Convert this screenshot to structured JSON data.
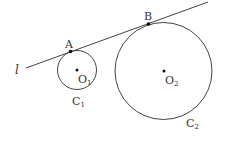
{
  "diagram": {
    "line_label": "l",
    "point_a": "A",
    "point_b": "B",
    "center1": {
      "main": "O",
      "sub": "1"
    },
    "center2": {
      "main": "O",
      "sub": "2"
    },
    "circle1": {
      "main": "C",
      "sub": "1"
    },
    "circle2": {
      "main": "C",
      "sub": "2"
    },
    "colors": {
      "stroke": "#444444",
      "point": "#111111"
    }
  }
}
